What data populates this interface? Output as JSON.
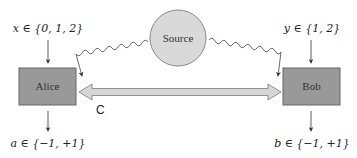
{
  "diagram": {
    "source": {
      "label": "Source",
      "fill": "#d9d9d9",
      "stroke": "#888888"
    },
    "alice": {
      "label": "Alice",
      "input_label": "x ∈ {0, 1, 2}",
      "output_label": "a ∈ {−1, +1}",
      "fill": "#999999",
      "stroke": "#666666"
    },
    "bob": {
      "label": "Bob",
      "input_label": "y ∈ {1, 2}",
      "output_label": "b ∈ {−1, +1}",
      "fill": "#999999",
      "stroke": "#666666"
    },
    "channel": {
      "label": "C",
      "fill": "#d6d6d6",
      "stroke": "#888888"
    },
    "edges": [
      {
        "from": "Source",
        "to": "Alice",
        "style": "wavy-arrow"
      },
      {
        "from": "Source",
        "to": "Bob",
        "style": "wavy-arrow"
      },
      {
        "from": "Alice",
        "to": "Bob",
        "style": "double-arrow",
        "label": "C"
      }
    ]
  }
}
